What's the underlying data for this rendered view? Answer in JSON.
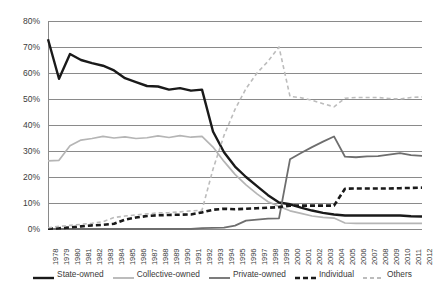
{
  "chart_data": {
    "type": "line",
    "title": "",
    "subtitle": "",
    "xlabel": "",
    "ylabel": "",
    "ylim": [
      0,
      80
    ],
    "ytick_labels": [
      "0%",
      "10%",
      "20%",
      "30%",
      "40%",
      "50%",
      "60%",
      "70%",
      "80%"
    ],
    "ytick_values": [
      0,
      10,
      20,
      30,
      40,
      50,
      60,
      70,
      80
    ],
    "grid": true,
    "legend_position": "bottom",
    "x": [
      1978,
      1979,
      1980,
      1981,
      1982,
      1983,
      1984,
      1985,
      1986,
      1987,
      1988,
      1989,
      1990,
      1991,
      1992,
      1993,
      1994,
      1995,
      1996,
      1997,
      1998,
      1999,
      2000,
      2001,
      2002,
      2003,
      2004,
      2005,
      2006,
      2007,
      2008,
      2009,
      2010,
      2011,
      2012
    ],
    "categories": [
      "1978",
      "1979",
      "1980",
      "1981",
      "1982",
      "1983",
      "1984",
      "1985",
      "1986",
      "1987",
      "1988",
      "1989",
      "1990",
      "1991",
      "1992",
      "1993",
      "1994",
      "1995",
      "1996",
      "1997",
      "1998",
      "1999",
      "2000",
      "2001",
      "2002",
      "2003",
      "2004",
      "2005",
      "2006",
      "2007",
      "2008",
      "2009",
      "2010",
      "2011",
      "2012"
    ],
    "series": [
      {
        "name": "State-owned",
        "color": "#1a1a1a",
        "style": "solid",
        "width": 2.4,
        "values": [
          73.0,
          57.8,
          67.3,
          65.0,
          63.8,
          62.8,
          61.0,
          58.0,
          56.5,
          55.0,
          54.8,
          53.6,
          54.2,
          53.2,
          53.6,
          37.5,
          29.5,
          24.0,
          20.0,
          16.5,
          13.0,
          10.2,
          9.5,
          8.2,
          7.1,
          6.2,
          5.6,
          5.2,
          5.2,
          5.2,
          5.2,
          5.2,
          5.2,
          4.9,
          4.8
        ]
      },
      {
        "name": "Collective-owned",
        "color": "#b5b5b5",
        "style": "solid",
        "width": 1.7,
        "values": [
          26.2,
          26.4,
          32.0,
          34.2,
          34.8,
          35.6,
          35.0,
          35.4,
          34.8,
          35.1,
          35.8,
          35.2,
          35.9,
          35.3,
          35.6,
          31.5,
          26.0,
          21.0,
          17.0,
          13.5,
          10.5,
          8.7,
          7.0,
          6.0,
          5.0,
          4.5,
          4.2,
          2.3,
          2.2,
          2.2,
          2.2,
          2.2,
          2.2,
          2.2,
          2.2
        ]
      },
      {
        "name": "Private-owned",
        "color": "#6e6e6e",
        "style": "solid",
        "width": 1.8,
        "values": [
          0.0,
          0.0,
          0.0,
          0.0,
          0.0,
          0.0,
          0.0,
          0.0,
          0.0,
          0.0,
          0.0,
          0.0,
          0.0,
          0.0,
          0.3,
          0.4,
          0.5,
          1.3,
          3.2,
          3.6,
          4.0,
          4.1,
          26.8,
          29.2,
          31.5,
          33.6,
          35.6,
          27.8,
          27.6,
          27.9,
          28.0,
          28.6,
          29.2,
          28.4,
          28.1
        ]
      },
      {
        "name": "Individual",
        "color": "#1a1a1a",
        "style": "dashed",
        "width": 2.6,
        "values": [
          0.1,
          0.3,
          0.6,
          1.0,
          1.4,
          1.6,
          2.0,
          3.6,
          4.4,
          5.0,
          5.3,
          5.4,
          5.5,
          5.6,
          6.4,
          7.4,
          7.8,
          7.6,
          7.8,
          8.0,
          8.2,
          8.4,
          9.0,
          9.0,
          9.0,
          9.0,
          9.0,
          15.5,
          15.6,
          15.6,
          15.6,
          15.6,
          15.7,
          15.8,
          15.9
        ]
      },
      {
        "name": "Others",
        "color": "#bcbcbc",
        "style": "dashed",
        "width": 1.6,
        "values": [
          0.5,
          1.0,
          1.4,
          1.8,
          2.2,
          2.8,
          4.4,
          5.0,
          5.4,
          5.8,
          6.2,
          6.3,
          6.6,
          7.0,
          7.2,
          23.0,
          36.0,
          46.0,
          54.0,
          60.0,
          64.5,
          70.0,
          51.0,
          50.5,
          49.5,
          48.2,
          47.0,
          50.3,
          50.6,
          50.6,
          50.6,
          50.2,
          50.0,
          50.6,
          50.8
        ]
      }
    ]
  },
  "legend": {
    "items": [
      {
        "label": "State-owned"
      },
      {
        "label": "Collective-owned"
      },
      {
        "label": "Private-owned"
      },
      {
        "label": "Individual"
      },
      {
        "label": "Others"
      }
    ]
  }
}
